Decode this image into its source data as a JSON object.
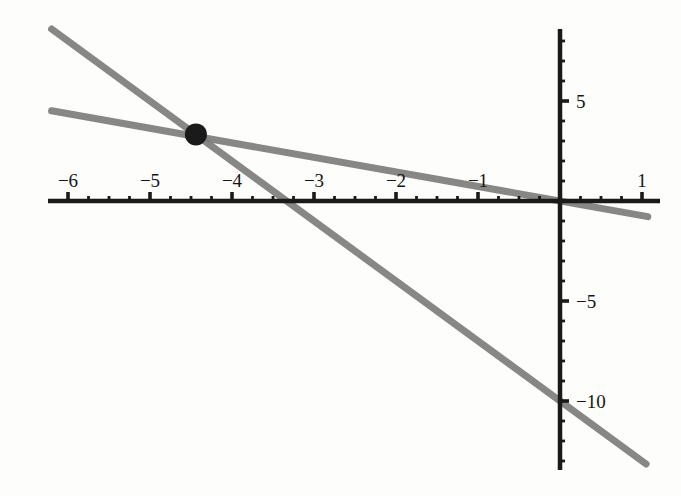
{
  "figure": {
    "background_color": "#fdfdfb",
    "axis_color": "#1a1a1a",
    "line_color": "#7d7d7d",
    "point_color": "#1a1a1a",
    "width": 681,
    "height": 496
  },
  "axes": {
    "origin_px": {
      "x": 560,
      "y": 201
    },
    "x_unit_px": 82,
    "y_unit_px": 20,
    "x_axis_extent_px": {
      "left": 48,
      "right": 660
    },
    "y_axis_extent_px": {
      "top": 29,
      "bottom": 470
    },
    "x_minor_tick_step": 0.25,
    "y_minor_tick_step": 1,
    "x_major_tick_step": 1,
    "y_major_tick_step": 5,
    "x_tick_labels": [
      {
        "value": -6,
        "text": "−6"
      },
      {
        "value": -5,
        "text": "−5"
      },
      {
        "value": -4,
        "text": "−4"
      },
      {
        "value": -3,
        "text": "−3"
      },
      {
        "value": -2,
        "text": "−2"
      },
      {
        "value": -1,
        "text": "−1"
      },
      {
        "value": 1,
        "text": "1"
      }
    ],
    "y_tick_labels": [
      {
        "value": 5,
        "text": "5"
      },
      {
        "value": -5,
        "text": "−5"
      },
      {
        "value": -10,
        "text": "−10"
      }
    ]
  },
  "chart_data": {
    "type": "line",
    "title": "",
    "xlabel": "",
    "ylabel": "",
    "xlim": [
      -6.25,
      1.22
    ],
    "ylim": [
      -13.45,
      8.6
    ],
    "grid": false,
    "legend": "none",
    "series": [
      {
        "name": "steep-line",
        "slope": -3,
        "intercept": -10,
        "equation": "y = -3x - 10",
        "color": "#7d7d7d",
        "x": [
          -6.2,
          1.05
        ],
        "y": [
          8.6,
          -13.15
        ],
        "x_intercept": -3.333
      },
      {
        "name": "shallow-line",
        "slope": -0.727,
        "intercept": 0,
        "equation": "y = -0.727x",
        "color": "#7d7d7d",
        "x": [
          -6.2,
          1.07
        ],
        "y": [
          4.51,
          -0.78
        ],
        "x_intercept": 0
      }
    ],
    "points": [
      {
        "name": "intersection-point",
        "x": -4.44,
        "y": 3.33,
        "color": "#1a1a1a",
        "radius_px": 11
      }
    ]
  }
}
